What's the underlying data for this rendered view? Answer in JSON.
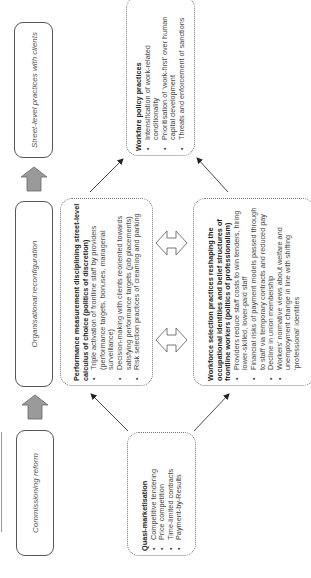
{
  "stages": [
    {
      "label": "Street-level practices with clients"
    },
    {
      "label": "Organisational reconfiguration"
    },
    {
      "label": "Commissioning reform"
    }
  ],
  "boxes": {
    "workfare": {
      "title": "Workfare policy practices",
      "items": [
        "Intensification of work-related conditionality",
        "Prioritisation of ‘work-first’ over human capital development",
        "Threats and enforcement of sanctions"
      ]
    },
    "performance": {
      "title": "Performance measurement disciplining street-level calculus of choice (politics of discretion)",
      "items": [
        "Triple activation of frontline staff by providers (performance targets, bonuses, managerial surveillance)",
        "Decision-making with clients reoriented towards satisfying performance targets (job placements)",
        "Risk selection practices of creaming and parking"
      ]
    },
    "workforce": {
      "title": "Workforce selection practices reshaping the occupational identities and belief structures of frontline workers (politics of professionalism)",
      "items": [
        "Providers reduce staff costs to win tenders, hiring lower-skilled, lower-paid staff",
        "Financial risks of payment models passed through to staff via temporary contracts and reduced pay",
        "Decline in union membership",
        "Workers’ normative views about welfare and unemployment change in line with shifting ‘professional’ identities"
      ]
    },
    "quasi": {
      "title": "Quasi-marketisation",
      "items": [
        "Competitive tendering",
        "Price competition",
        "Time-limited contracts",
        "Payment-by-Results"
      ]
    }
  },
  "colors": {
    "block_arrow_fill": "#9a9a9a",
    "line": "#333333"
  }
}
